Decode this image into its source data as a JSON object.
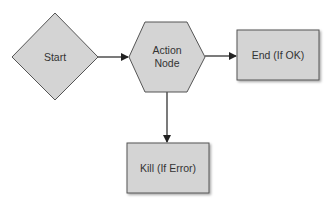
{
  "diagram": {
    "type": "flowchart",
    "nodes": [
      {
        "id": "start",
        "shape": "diamond",
        "lines": [
          "Start"
        ]
      },
      {
        "id": "action",
        "shape": "hexagon",
        "lines": [
          "Action",
          "Node"
        ]
      },
      {
        "id": "end",
        "shape": "rectangle",
        "lines": [
          "End (If OK)"
        ]
      },
      {
        "id": "kill",
        "shape": "rectangle",
        "lines": [
          "Kill (If Error)"
        ]
      }
    ],
    "edges": [
      {
        "from": "start",
        "to": "action"
      },
      {
        "from": "action",
        "to": "end"
      },
      {
        "from": "action",
        "to": "kill"
      }
    ],
    "colors": {
      "fill": "#d4d4d4",
      "stroke": "#555555",
      "text": "#333333",
      "edge": "#222222"
    }
  }
}
